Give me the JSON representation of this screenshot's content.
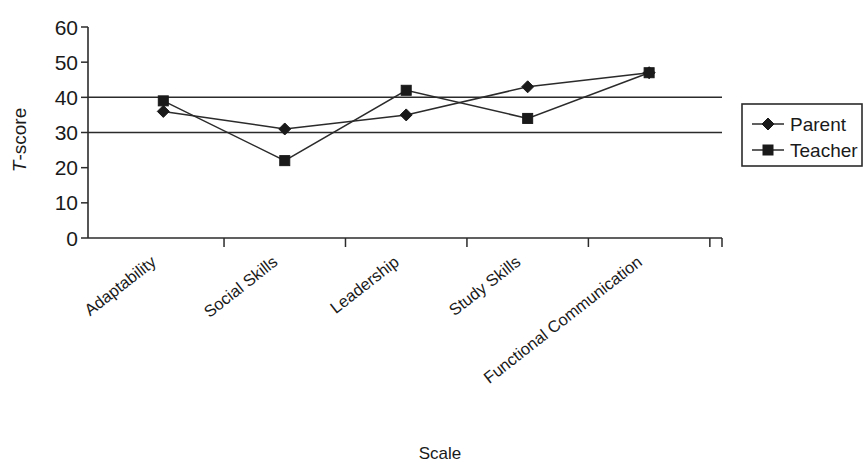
{
  "chart_data": {
    "type": "line",
    "title": "",
    "xlabel": "Scale",
    "ylabel": "T-score",
    "ylabel_italic_prefix": "T",
    "ylabel_rest": "-score",
    "categories": [
      "Adaptability",
      "Social Skills",
      "Leadership",
      "Study Skills",
      "Functional Communication"
    ],
    "series": [
      {
        "name": "Parent",
        "marker": "diamond",
        "values": [
          36,
          31,
          35,
          43,
          47
        ]
      },
      {
        "name": "Teacher",
        "marker": "square",
        "values": [
          39,
          22,
          42,
          34,
          47
        ]
      }
    ],
    "ylim": [
      0,
      60
    ],
    "yticks": [
      0,
      10,
      20,
      30,
      40,
      50,
      60
    ],
    "ytick_labels": [
      "0",
      "10",
      "20",
      "30",
      "40",
      "50",
      "60"
    ],
    "reference_lines": [
      {
        "value": 40,
        "label": ""
      },
      {
        "value": 30,
        "label": ""
      }
    ],
    "grid": false,
    "legend_position": "right",
    "legend_entries": [
      "Parent",
      "Teacher"
    ],
    "colors": {
      "line": "#2b2b2b",
      "marker": "#1a1a1a",
      "axis": "#2b2b2b",
      "background": "#ffffff",
      "text": "#1a1a1a"
    }
  }
}
